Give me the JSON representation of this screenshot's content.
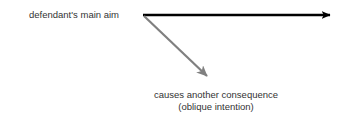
{
  "diagram": {
    "background_color": "#ffffff",
    "labels": {
      "main_aim": "defendant's main aim",
      "consequence_line1": "causes another consequence",
      "consequence_line2": "(oblique intention)"
    },
    "arrows": {
      "main_aim_arrow": {
        "name": "horizontal-arrow",
        "color": "#000000",
        "from_x": 143,
        "from_y": 15,
        "to_x": 338,
        "to_y": 15,
        "thickness": 2.6
      },
      "consequence_arrow": {
        "name": "diagonal-arrow",
        "color": "#808080",
        "from_x": 144,
        "from_y": 16,
        "to_x": 215,
        "to_y": 84,
        "thickness": 2.2
      }
    },
    "text_color": "#333333"
  }
}
